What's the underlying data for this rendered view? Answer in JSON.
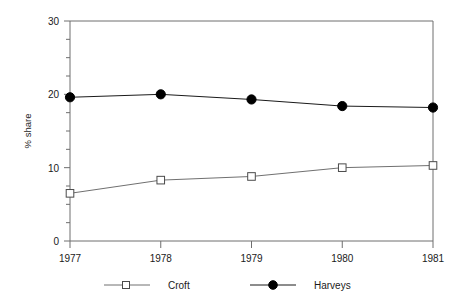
{
  "chart_data": {
    "type": "line",
    "title": "",
    "xlabel": "",
    "ylabel": "% share",
    "categories": [
      "1977",
      "1978",
      "1979",
      "1980",
      "1981"
    ],
    "x": [
      1977,
      1978,
      1979,
      1980,
      1981
    ],
    "ylim": [
      0,
      30
    ],
    "yticks": [
      0,
      10,
      20,
      30
    ],
    "ytick_labels": [
      "0",
      "10",
      "20",
      "30"
    ],
    "yminor_ticks": [
      2.5,
      5,
      7.5,
      12.5,
      15,
      17.5,
      22.5,
      25,
      27.5
    ],
    "grid": false,
    "legend_position": "bottom",
    "series": [
      {
        "name": "Croft",
        "marker": "open-square",
        "color": "#707070",
        "values": [
          6.5,
          8.3,
          8.8,
          10.0,
          10.3
        ]
      },
      {
        "name": "Harveys",
        "marker": "filled-circle",
        "color": "#000000",
        "values": [
          19.6,
          20.0,
          19.3,
          18.4,
          18.2
        ]
      }
    ]
  },
  "axis": {
    "y_title": "% share",
    "y_labels": [
      "30",
      "20",
      "10",
      "0"
    ],
    "x_labels": [
      "1977",
      "1978",
      "1979",
      "1980",
      "1981"
    ]
  },
  "legend": {
    "items": [
      {
        "label": "Croft",
        "marker": "open-square"
      },
      {
        "label": "Harveys",
        "marker": "filled-circle"
      }
    ]
  }
}
